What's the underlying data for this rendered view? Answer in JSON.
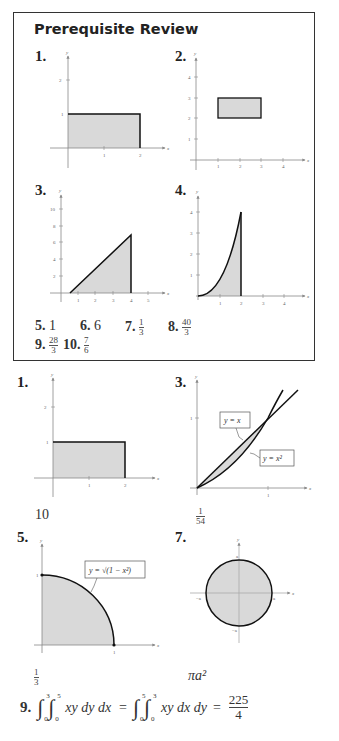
{
  "prerequisite_review": {
    "title": "Prerequisite Review",
    "graphs": [
      {
        "label": "1.",
        "x_ticks": [
          "1",
          "2"
        ],
        "y_ticks": [
          "1",
          "2"
        ],
        "axis_x": "x",
        "axis_y": "y",
        "shape": "rectangle [0,2]x[0,1]"
      },
      {
        "label": "2.",
        "x_ticks": [
          "1",
          "2",
          "3",
          "4"
        ],
        "y_ticks": [
          "1",
          "2",
          "3",
          "4"
        ],
        "axis_x": "x",
        "axis_y": "y",
        "shape": "rectangle [1,3]x[2,3]"
      },
      {
        "label": "3.",
        "x_ticks": [
          "1",
          "2",
          "3",
          "4",
          "5"
        ],
        "y_ticks": [
          "2",
          "4",
          "6",
          "8",
          "10"
        ],
        "axis_x": "x",
        "axis_y": "y",
        "shape": "triangle under line up to x=4"
      },
      {
        "label": "4.",
        "x_ticks": [
          "1",
          "2",
          "3",
          "4"
        ],
        "y_ticks": [
          "1",
          "2",
          "3",
          "4"
        ],
        "axis_x": "x",
        "axis_y": "y",
        "shape": "region under y=x^2 from 0 to 2"
      }
    ],
    "answers": [
      {
        "label": "5.",
        "value": "1"
      },
      {
        "label": "6.",
        "value": "6"
      },
      {
        "label": "7.",
        "num": "1",
        "den": "3"
      },
      {
        "label": "8.",
        "num": "40",
        "den": "3"
      },
      {
        "label": "9.",
        "num": "28",
        "den": "3"
      },
      {
        "label": "10.",
        "num": "7",
        "den": "6"
      }
    ]
  },
  "exercises": {
    "ex1": {
      "label": "1.",
      "x_ticks": [
        "1",
        "2"
      ],
      "y_ticks": [
        "1",
        "2"
      ],
      "answer": "10"
    },
    "ex3": {
      "label": "3.",
      "x_ticks": [
        "1"
      ],
      "y_ticks": [
        "1"
      ],
      "callout_line": "y = x",
      "callout_curve": "y = x²",
      "answer_num": "1",
      "answer_den": "54"
    },
    "ex5": {
      "label": "5.",
      "x_ticks": [
        "1"
      ],
      "y_ticks": [
        "1"
      ],
      "callout": "y = √(1 − x²)",
      "answer_num": "1",
      "answer_den": "3"
    },
    "ex7": {
      "label": "7.",
      "tick_a": "a",
      "tick_neg_a": "−a",
      "answer": "πa²"
    },
    "ex9": {
      "label": "9.",
      "lhs_outer_upper": "3",
      "lhs_outer_lower": "0",
      "lhs_inner_upper": "5",
      "lhs_inner_lower": "0",
      "lhs_integrand": "xy dy dx",
      "rhs_outer_upper": "5",
      "rhs_outer_lower": "0",
      "rhs_inner_upper": "3",
      "rhs_inner_lower": "0",
      "rhs_integrand": "xy dx dy",
      "result_num": "225",
      "result_den": "4"
    }
  },
  "colors": {
    "fill": "#d9d9d9",
    "stroke": "#111111",
    "axis": "#888888",
    "border": "#333333"
  }
}
